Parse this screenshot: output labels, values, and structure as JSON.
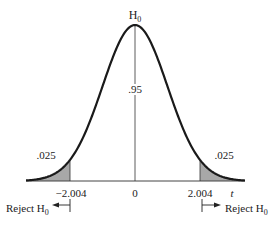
{
  "figure": {
    "title_label": "H",
    "title_sub": "0",
    "center_area_label": ".95",
    "left_tail_label": ".025",
    "right_tail_label": ".025",
    "tick_left": "−2.004",
    "tick_center": "0",
    "tick_right": "2.004",
    "axis_label": "t",
    "reject_left_label": "Reject H",
    "reject_left_sub": "0",
    "reject_right_label": "Reject H",
    "reject_right_sub": "0",
    "shade_color": "#a8a8a8",
    "curve_color": "#1a1a1a"
  },
  "chart_data": {
    "type": "area",
    "title": "H0",
    "distribution": "t (approximately normal)",
    "x_ticks": [
      -2.004,
      0,
      2.004
    ],
    "xlabel": "t",
    "regions": [
      {
        "name": "left rejection region",
        "range": [
          null,
          -2.004
        ],
        "area": 0.025,
        "shaded": true
      },
      {
        "name": "acceptance region",
        "range": [
          -2.004,
          2.004
        ],
        "area": 0.95,
        "shaded": false
      },
      {
        "name": "right rejection region",
        "range": [
          2.004,
          null
        ],
        "area": 0.025,
        "shaded": true
      }
    ],
    "annotations": [
      "Reject H0 (left of -2.004)",
      "Reject H0 (right of 2.004)"
    ]
  }
}
